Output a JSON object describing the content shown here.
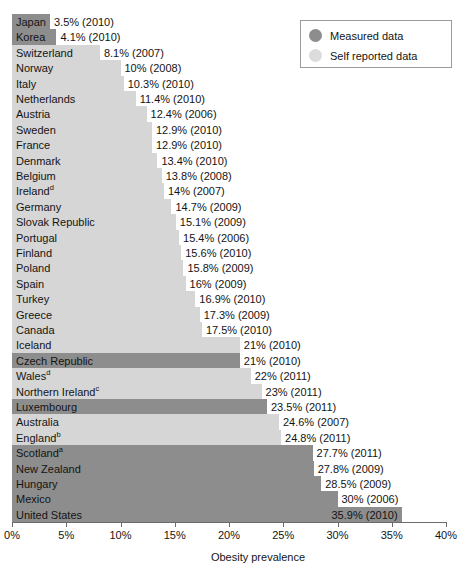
{
  "chart_data": {
    "type": "bar",
    "orientation": "horizontal",
    "title": "",
    "xlabel": "Obesity prevalence",
    "ylabel": "",
    "xlim": [
      0,
      40
    ],
    "xticks": [
      0,
      5,
      10,
      15,
      20,
      25,
      30,
      35,
      40
    ],
    "xtick_labels": [
      "0%",
      "5%",
      "10%",
      "15%",
      "20%",
      "25%",
      "30%",
      "35%",
      "40%"
    ],
    "grid": false,
    "legend_position": "top-right",
    "legend": [
      {
        "key": "measured",
        "label": "Measured data",
        "color": "#8d8d8d"
      },
      {
        "key": "self",
        "label": "Self reported data",
        "color": "#dcdcdc"
      }
    ],
    "categories": [
      "Japan",
      "Korea",
      "Switzerland",
      "Norway",
      "Italy",
      "Netherlands",
      "Austria",
      "Sweden",
      "France",
      "Denmark",
      "Belgium",
      "Ireland",
      "Germany",
      "Slovak Republic",
      "Portugal",
      "Finland",
      "Poland",
      "Spain",
      "Turkey",
      "Greece",
      "Canada",
      "Iceland",
      "Czech Republic",
      "Wales",
      "Northern Ireland",
      "Luxembourg",
      "Australia",
      "England",
      "Scotland",
      "New Zealand",
      "Hungary",
      "Mexico",
      "United States"
    ],
    "values": [
      3.5,
      4.1,
      8.1,
      10,
      10.3,
      11.4,
      12.4,
      12.9,
      12.9,
      13.4,
      13.8,
      14,
      14.7,
      15.1,
      15.4,
      15.6,
      15.8,
      16,
      16.9,
      17.3,
      17.5,
      21,
      21,
      22,
      23,
      23.5,
      24.6,
      24.8,
      27.7,
      27.8,
      28.5,
      30,
      35.9
    ],
    "rows": [
      {
        "country": "Japan",
        "superscript": "",
        "value": 3.5,
        "year": "2010",
        "value_label": "3.5% (2010)",
        "series": "measured"
      },
      {
        "country": "Korea",
        "superscript": "",
        "value": 4.1,
        "year": "2010",
        "value_label": "4.1% (2010)",
        "series": "measured"
      },
      {
        "country": "Switzerland",
        "superscript": "",
        "value": 8.1,
        "year": "2007",
        "value_label": "8.1% (2007)",
        "series": "self"
      },
      {
        "country": "Norway",
        "superscript": "",
        "value": 10,
        "year": "2008",
        "value_label": "10% (2008)",
        "series": "self"
      },
      {
        "country": "Italy",
        "superscript": "",
        "value": 10.3,
        "year": "2010",
        "value_label": "10.3% (2010)",
        "series": "self"
      },
      {
        "country": "Netherlands",
        "superscript": "",
        "value": 11.4,
        "year": "2010",
        "value_label": "11.4% (2010)",
        "series": "self"
      },
      {
        "country": "Austria",
        "superscript": "",
        "value": 12.4,
        "year": "2006",
        "value_label": "12.4% (2006)",
        "series": "self"
      },
      {
        "country": "Sweden",
        "superscript": "",
        "value": 12.9,
        "year": "2010",
        "value_label": "12.9% (2010)",
        "series": "self"
      },
      {
        "country": "France",
        "superscript": "",
        "value": 12.9,
        "year": "2010",
        "value_label": "12.9% (2010)",
        "series": "self"
      },
      {
        "country": "Denmark",
        "superscript": "",
        "value": 13.4,
        "year": "2010",
        "value_label": "13.4% (2010)",
        "series": "self"
      },
      {
        "country": "Belgium",
        "superscript": "",
        "value": 13.8,
        "year": "2008",
        "value_label": "13.8% (2008)",
        "series": "self"
      },
      {
        "country": "Ireland",
        "superscript": "d",
        "value": 14,
        "year": "2007",
        "value_label": "14% (2007)",
        "series": "self"
      },
      {
        "country": "Germany",
        "superscript": "",
        "value": 14.7,
        "year": "2009",
        "value_label": "14.7% (2009)",
        "series": "self"
      },
      {
        "country": "Slovak Republic",
        "superscript": "",
        "value": 15.1,
        "year": "2009",
        "value_label": "15.1% (2009)",
        "series": "self"
      },
      {
        "country": "Portugal",
        "superscript": "",
        "value": 15.4,
        "year": "2006",
        "value_label": "15.4% (2006)",
        "series": "self"
      },
      {
        "country": "Finland",
        "superscript": "",
        "value": 15.6,
        "year": "2010",
        "value_label": "15.6% (2010)",
        "series": "self"
      },
      {
        "country": "Poland",
        "superscript": "",
        "value": 15.8,
        "year": "2009",
        "value_label": "15.8% (2009)",
        "series": "self"
      },
      {
        "country": "Spain",
        "superscript": "",
        "value": 16,
        "year": "2009",
        "value_label": "16% (2009)",
        "series": "self"
      },
      {
        "country": "Turkey",
        "superscript": "",
        "value": 16.9,
        "year": "2010",
        "value_label": "16.9% (2010)",
        "series": "self"
      },
      {
        "country": "Greece",
        "superscript": "",
        "value": 17.3,
        "year": "2009",
        "value_label": "17.3% (2009)",
        "series": "self"
      },
      {
        "country": "Canada",
        "superscript": "",
        "value": 17.5,
        "year": "2010",
        "value_label": "17.5% (2010)",
        "series": "self"
      },
      {
        "country": "Iceland",
        "superscript": "",
        "value": 21,
        "year": "2010",
        "value_label": "21% (2010)",
        "series": "self"
      },
      {
        "country": "Czech Republic",
        "superscript": "",
        "value": 21,
        "year": "2010",
        "value_label": "21% (2010)",
        "series": "measured"
      },
      {
        "country": "Wales",
        "superscript": "d",
        "value": 22,
        "year": "2011",
        "value_label": "22% (2011)",
        "series": "self"
      },
      {
        "country": "Northern Ireland",
        "superscript": "c",
        "value": 23,
        "year": "2011",
        "value_label": "23% (2011)",
        "series": "self"
      },
      {
        "country": "Luxembourg",
        "superscript": "",
        "value": 23.5,
        "year": "2011",
        "value_label": "23.5% (2011)",
        "series": "measured"
      },
      {
        "country": "Australia",
        "superscript": "",
        "value": 24.6,
        "year": "2007",
        "value_label": "24.6% (2007)",
        "series": "self"
      },
      {
        "country": "England",
        "superscript": "b",
        "value": 24.8,
        "year": "2011",
        "value_label": "24.8% (2011)",
        "series": "self"
      },
      {
        "country": "Scotland",
        "superscript": "a",
        "value": 27.7,
        "year": "2011",
        "value_label": "27.7% (2011)",
        "series": "measured"
      },
      {
        "country": "New Zealand",
        "superscript": "",
        "value": 27.8,
        "year": "2009",
        "value_label": "27.8% (2009)",
        "series": "measured"
      },
      {
        "country": "Hungary",
        "superscript": "",
        "value": 28.5,
        "year": "2009",
        "value_label": "28.5% (2009)",
        "series": "measured"
      },
      {
        "country": "Mexico",
        "superscript": "",
        "value": 30,
        "year": "2006",
        "value_label": "30% (2006)",
        "series": "measured"
      },
      {
        "country": "United States",
        "superscript": "",
        "value": 35.9,
        "year": "2010",
        "value_label": "35.9% (2010)",
        "series": "measured"
      }
    ]
  }
}
